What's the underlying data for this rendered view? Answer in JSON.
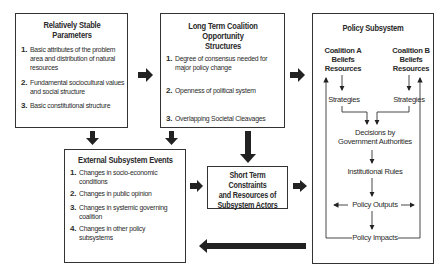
{
  "boxes": {
    "stable_parameters": {
      "title": "Relatively Stable Parameters",
      "items": [
        {
          "num": "1.",
          "lines": [
            "Basic attributes of the problem",
            "area and distribution of natural",
            "resources"
          ]
        },
        {
          "num": "2.",
          "lines": [
            "Fundamental sociocultural values",
            "and social structure"
          ]
        },
        {
          "num": "3.",
          "lines": [
            "Basic constitutional structure"
          ]
        }
      ]
    },
    "long_term_structures": {
      "title_lines": [
        "Long Term Coalition Opportunity",
        "Structures"
      ],
      "items": [
        {
          "num": "1.",
          "lines": [
            "Degree of consensus needed for",
            "major policy change"
          ]
        },
        {
          "num": "2.",
          "lines": [
            "Openness of political system"
          ]
        },
        {
          "num": "3.",
          "lines": [
            "Overlapping Societal Cleavages"
          ]
        }
      ]
    },
    "external_events": {
      "title": "External Subsystem Events",
      "items": [
        {
          "num": "1.",
          "lines": [
            "Changes in socio-economic",
            "conditions"
          ]
        },
        {
          "num": "2.",
          "lines": [
            "Changes in public opinion"
          ]
        },
        {
          "num": "3.",
          "lines": [
            "Changes in systemic governing",
            "coalition"
          ]
        },
        {
          "num": "4.",
          "lines": [
            "Changes in other policy",
            "subsystems"
          ]
        }
      ]
    },
    "short_term_constraints": {
      "lines": [
        "Short Term Constraints",
        "and Resources of",
        "Subsystem Actors"
      ]
    },
    "policy_subsystem": {
      "title": "Policy Subsystem",
      "coalition_a": [
        "Coalition A",
        "Beliefs",
        "Resources"
      ],
      "coalition_b": [
        "Coalition B",
        "Beliefs",
        "Resources"
      ],
      "strategies_a": "Strategies",
      "strategies_b": "Strategies",
      "decisions": [
        "Decisions by",
        "Government Authorities"
      ],
      "institutional_rules": "Institutional Rules",
      "policy_outputs": "Policy Outputs",
      "policy_impacts": "Policy Impacts"
    }
  },
  "colors": {
    "arrow": "#222222",
    "border": "#333333",
    "text": "#2a2a2a"
  }
}
